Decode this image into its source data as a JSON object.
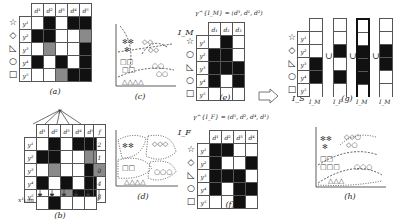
{
  "panel_a": {
    "caption": "(a)",
    "columns": [
      "d¹",
      "d²",
      "d³",
      "d⁴",
      "d⁵"
    ],
    "rows": [
      {
        "label": "y¹",
        "shape": "☆",
        "cells": [
          "w",
          "b",
          "w",
          "b",
          "b"
        ]
      },
      {
        "label": "y²",
        "shape": "◇",
        "cells": [
          "b",
          "b",
          "w",
          "w",
          "g"
        ]
      },
      {
        "label": "y³",
        "shape": "◺",
        "cells": [
          "w",
          "g",
          "w",
          "w",
          "b"
        ]
      },
      {
        "label": "y⁴",
        "shape": "○",
        "cells": [
          "b",
          "w",
          "b",
          "w",
          "b"
        ]
      },
      {
        "label": "y⁵",
        "shape": "□",
        "cells": [
          "w",
          "w",
          "g",
          "b",
          "b"
        ]
      }
    ]
  },
  "panel_b": {
    "caption": "(b)",
    "top_label": "y",
    "columns": [
      "d¹",
      "d²",
      "d³",
      "d⁴",
      "d⁵"
    ],
    "f_header": "f",
    "f_values": [
      "2",
      "1",
      "0",
      "4",
      "8"
    ],
    "rows": [
      {
        "label": "y¹",
        "cells": [
          "w",
          "b",
          "w",
          "b",
          "b"
        ]
      },
      {
        "label": "y²",
        "cells": [
          "b",
          "b",
          "w",
          "w",
          "g"
        ]
      },
      {
        "label": "y³",
        "cells": [
          "w",
          "g",
          "w",
          "w",
          "b"
        ]
      },
      {
        "label": "y⁴",
        "cells": [
          "b",
          "w",
          "b",
          "w",
          "b"
        ]
      },
      {
        "label": "y⁵",
        "cells": [
          "w",
          "w",
          "g",
          "b",
          "b"
        ]
      }
    ],
    "bottom_label": "x¹₁:m",
    "bottom_cells": [
      "w",
      "b",
      "w",
      "w",
      "w"
    ]
  },
  "panel_c": {
    "caption": "(c)",
    "labels": [
      "h¹",
      "h²",
      "h³"
    ]
  },
  "panel_d": {
    "caption": "(d)",
    "labels": [
      "h¹",
      "h²",
      "h³",
      "h⁴"
    ]
  },
  "panel_e": {
    "caption": "(e)",
    "title": "I_M",
    "formula": "γ^{I_M} = (d³, d¹, d²)",
    "columns": [
      "d₁",
      "d₂",
      "d₃"
    ],
    "rows": [
      {
        "label": "y¹",
        "shape": "☆",
        "cells": [
          "w",
          "b",
          "w"
        ]
      },
      {
        "label": "y²",
        "shape": "○",
        "cells": [
          "b",
          "b",
          "w"
        ]
      },
      {
        "label": "y³",
        "shape": "◺",
        "cells": [
          "b",
          "b",
          "b"
        ]
      },
      {
        "label": "y⁴",
        "shape": "○",
        "cells": [
          "b",
          "w",
          "b"
        ]
      },
      {
        "label": "y⁵",
        "shape": "□",
        "cells": [
          "w",
          "w",
          "w"
        ]
      }
    ]
  },
  "panel_f": {
    "caption": "(f)",
    "title": "I_F",
    "formula": "γ^{I_F} = (d⁵, d², d⁴, d¹)",
    "columns": [
      "d¹",
      "d²",
      "d³",
      "d⁴"
    ],
    "rows": [
      {
        "label": "y¹",
        "shape": "☆",
        "cells": [
          "b",
          "b",
          "w",
          "w"
        ]
      },
      {
        "label": "y²",
        "shape": "◇",
        "cells": [
          "b",
          "w",
          "w",
          "b"
        ]
      },
      {
        "label": "y³",
        "shape": "◺",
        "cells": [
          "b",
          "b",
          "b",
          "w"
        ]
      },
      {
        "label": "y⁴",
        "shape": "○",
        "cells": [
          "b",
          "w",
          "b",
          "b"
        ]
      },
      {
        "label": "y⁵",
        "shape": "□",
        "cells": [
          "w",
          "w",
          "b",
          "w"
        ]
      }
    ]
  },
  "panel_g": {
    "caption": "(g)",
    "is_label": "I_S",
    "union": "∪",
    "row_labels": [
      "y¹",
      "y²",
      "y³",
      "y⁴",
      "y⁵"
    ],
    "shapes": [
      "☆",
      "◇",
      "◺",
      "○",
      "□"
    ],
    "columns": [
      {
        "header": "d₃",
        "source": "I_M",
        "cells": [
          "w",
          "w",
          "b",
          "b",
          "w"
        ],
        "bold": false
      },
      {
        "header": "d₄",
        "source": "I_F",
        "cells": [
          "w",
          "b",
          "w",
          "b",
          "w"
        ],
        "bold": false
      },
      {
        "header": "d₁",
        "source": "I_M",
        "cells": [
          "w",
          "b",
          "b",
          "b",
          "w"
        ],
        "bold": true
      },
      {
        "header": "d₂",
        "source": "I_M",
        "cells": [
          "w",
          "b",
          "b",
          "w",
          "w"
        ],
        "bold": false
      }
    ]
  },
  "panel_h": {
    "caption": "(h)",
    "labels": [
      "h¹",
      "h²",
      "h³"
    ]
  }
}
